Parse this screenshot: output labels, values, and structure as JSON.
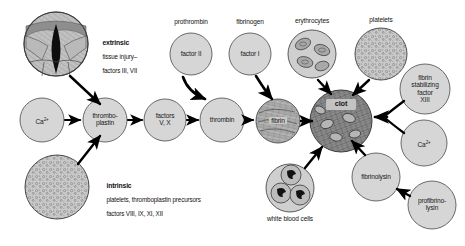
{
  "diagram": {
    "background_color": "#ffffff",
    "node_fill": "#d4d4d4",
    "node_stroke": "#555555",
    "arrow_color": "#000000"
  },
  "pathways": {
    "extrinsic": {
      "heading": "extrinsic",
      "line1": "tissue injury–",
      "line2": "factors III, VII"
    },
    "intrinsic": {
      "heading": "intrinsic",
      "line1": "platelets, thromboplastin precursors",
      "line2": "factors VIII, IX, XI, XII"
    }
  },
  "top_captions": {
    "prothrombin": "prothrombin",
    "fibrinogen": "fibrinogen",
    "erythrocytes": "erythrocytes",
    "platelets": "platelets"
  },
  "bottom_captions": {
    "white_blood_cells": "white blood cells"
  },
  "nodes": {
    "tissue_injury": {
      "label": ""
    },
    "platelet_mass": {
      "label": ""
    },
    "calcium_left": {
      "label": "Ca",
      "sup": "2+"
    },
    "thromboplastin": {
      "line1": "thrombo-",
      "line2": "plastin"
    },
    "factors_v_x": {
      "line1": "factors",
      "line2": "V, X"
    },
    "factor_ii": {
      "label": "factor II"
    },
    "factor_i": {
      "label": "factor I"
    },
    "thrombin": {
      "label": "thrombin"
    },
    "fibrin": {
      "label": "fibrin"
    },
    "erythrocytes": {
      "label": ""
    },
    "platelets": {
      "label": ""
    },
    "clot": {
      "label": "clot"
    },
    "white_blood_cells": {
      "label": ""
    },
    "fibrin_stabilizing": {
      "line1": "fibrin",
      "line2": "stabilizing",
      "line3": "factor",
      "line4": "XIII"
    },
    "calcium_right": {
      "label": "Ca",
      "sup": "2+"
    },
    "fibrinolysin": {
      "label": "fibrinolysin"
    },
    "profibrinolysin": {
      "line1": "profibrino-",
      "line2": "lysin"
    }
  }
}
